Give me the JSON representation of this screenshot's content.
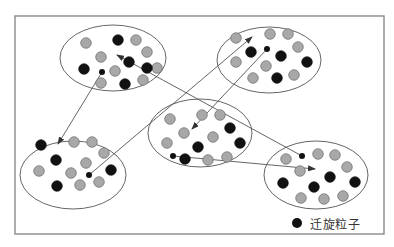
{
  "diagram": {
    "frame": {
      "x": 15,
      "y": 16,
      "width": 369,
      "height": 218,
      "stroke": "#8a8a8a"
    },
    "colors": {
      "migrating": "#111111",
      "normal": "#a8a8a8",
      "normal_stroke": "#6a6a6a",
      "ellipse_stroke": "#666666",
      "arrow": "#555555"
    },
    "clusters": [
      {
        "id": "top-left",
        "cx": 113,
        "cy": 58,
        "rx": 53,
        "ry": 33,
        "particles": [
          {
            "x": 86,
            "y": 43,
            "type": "normal"
          },
          {
            "x": 118,
            "y": 40,
            "type": "migrating"
          },
          {
            "x": 136,
            "y": 40,
            "type": "normal"
          },
          {
            "x": 147,
            "y": 52,
            "type": "normal"
          },
          {
            "x": 101,
            "y": 57,
            "type": "normal"
          },
          {
            "x": 129,
            "y": 62,
            "type": "migrating"
          },
          {
            "x": 157,
            "y": 68,
            "type": "normal"
          },
          {
            "x": 147,
            "y": 68,
            "type": "migrating"
          },
          {
            "x": 84,
            "y": 69,
            "type": "migrating"
          },
          {
            "x": 115,
            "y": 71,
            "type": "normal"
          },
          {
            "x": 101,
            "y": 83,
            "type": "normal"
          },
          {
            "x": 125,
            "y": 84,
            "type": "migrating"
          },
          {
            "x": 143,
            "y": 80,
            "type": "normal"
          }
        ],
        "departing": {
          "x": 102,
          "y": 72
        }
      },
      {
        "id": "top-right",
        "cx": 269,
        "cy": 60,
        "rx": 52,
        "ry": 33,
        "particles": [
          {
            "x": 236,
            "y": 38,
            "type": "normal"
          },
          {
            "x": 270,
            "y": 34,
            "type": "normal"
          },
          {
            "x": 288,
            "y": 34,
            "type": "normal"
          },
          {
            "x": 298,
            "y": 47,
            "type": "normal"
          },
          {
            "x": 251,
            "y": 52,
            "type": "migrating"
          },
          {
            "x": 281,
            "y": 56,
            "type": "migrating"
          },
          {
            "x": 236,
            "y": 62,
            "type": "normal"
          },
          {
            "x": 266,
            "y": 66,
            "type": "normal"
          },
          {
            "x": 307,
            "y": 62,
            "type": "migrating"
          },
          {
            "x": 253,
            "y": 78,
            "type": "normal"
          },
          {
            "x": 277,
            "y": 78,
            "type": "migrating"
          },
          {
            "x": 294,
            "y": 75,
            "type": "normal"
          }
        ],
        "departing": {
          "x": 267,
          "y": 49
        }
      },
      {
        "id": "center",
        "cx": 200,
        "cy": 133,
        "rx": 52,
        "ry": 34,
        "particles": [
          {
            "x": 170,
            "y": 119,
            "type": "normal"
          },
          {
            "x": 202,
            "y": 115,
            "type": "normal"
          },
          {
            "x": 220,
            "y": 115,
            "type": "normal"
          },
          {
            "x": 230,
            "y": 128,
            "type": "migrating"
          },
          {
            "x": 184,
            "y": 133,
            "type": "normal"
          },
          {
            "x": 213,
            "y": 137,
            "type": "normal"
          },
          {
            "x": 167,
            "y": 143,
            "type": "normal"
          },
          {
            "x": 198,
            "y": 147,
            "type": "migrating"
          },
          {
            "x": 240,
            "y": 143,
            "type": "migrating"
          },
          {
            "x": 185,
            "y": 159,
            "type": "migrating"
          },
          {
            "x": 208,
            "y": 160,
            "type": "normal"
          },
          {
            "x": 227,
            "y": 157,
            "type": "normal"
          }
        ],
        "departing": {
          "x": 173,
          "y": 156
        }
      },
      {
        "id": "bottom-left",
        "cx": 73,
        "cy": 175,
        "rx": 53,
        "ry": 34,
        "particles": [
          {
            "x": 41,
            "y": 145,
            "type": "migrating"
          },
          {
            "x": 74,
            "y": 142,
            "type": "normal"
          },
          {
            "x": 92,
            "y": 142,
            "type": "normal"
          },
          {
            "x": 104,
            "y": 153,
            "type": "normal"
          },
          {
            "x": 56,
            "y": 160,
            "type": "migrating"
          },
          {
            "x": 86,
            "y": 163,
            "type": "normal"
          },
          {
            "x": 39,
            "y": 171,
            "type": "normal"
          },
          {
            "x": 71,
            "y": 173,
            "type": "normal"
          },
          {
            "x": 111,
            "y": 170,
            "type": "migrating"
          },
          {
            "x": 57,
            "y": 186,
            "type": "migrating"
          },
          {
            "x": 80,
            "y": 185,
            "type": "normal"
          },
          {
            "x": 99,
            "y": 182,
            "type": "normal"
          }
        ],
        "departing": {
          "x": 89,
          "y": 175
        }
      },
      {
        "id": "bottom-right",
        "cx": 316,
        "cy": 175,
        "rx": 52,
        "ry": 34,
        "particles": [
          {
            "x": 286,
            "y": 159,
            "type": "normal"
          },
          {
            "x": 318,
            "y": 154,
            "type": "normal"
          },
          {
            "x": 335,
            "y": 155,
            "type": "normal"
          },
          {
            "x": 347,
            "y": 167,
            "type": "normal"
          },
          {
            "x": 300,
            "y": 171,
            "type": "normal"
          },
          {
            "x": 330,
            "y": 177,
            "type": "migrating"
          },
          {
            "x": 283,
            "y": 183,
            "type": "migrating"
          },
          {
            "x": 314,
            "y": 187,
            "type": "migrating"
          },
          {
            "x": 355,
            "y": 182,
            "type": "migrating"
          },
          {
            "x": 301,
            "y": 198,
            "type": "normal"
          },
          {
            "x": 324,
            "y": 199,
            "type": "normal"
          },
          {
            "x": 343,
            "y": 196,
            "type": "normal"
          }
        ],
        "departing": {
          "x": 302,
          "y": 156
        }
      }
    ],
    "arrows": [
      {
        "from": "top-left",
        "x1": 102,
        "y1": 72,
        "x2": 58,
        "y2": 144
      },
      {
        "from": "top-right",
        "x1": 267,
        "y1": 49,
        "x2": 192,
        "y2": 129
      },
      {
        "from": "bottom-left",
        "x1": 89,
        "y1": 175,
        "x2": 252,
        "y2": 37
      },
      {
        "from": "center",
        "x1": 173,
        "y1": 156,
        "x2": 315,
        "y2": 169
      },
      {
        "from": "bottom-right",
        "x1": 302,
        "y1": 156,
        "x2": 117,
        "y2": 55
      }
    ],
    "legend": {
      "dot": {
        "x": 297,
        "y": 223,
        "r": 5
      },
      "label": "迁旋粒子"
    }
  }
}
